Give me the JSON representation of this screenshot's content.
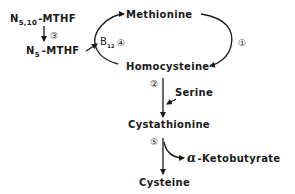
{
  "diagram": {
    "nodes": {
      "methionine": "Methionine",
      "homocysteine": "Homocysteine",
      "cystathionine": "Cystathionine",
      "cysteine": "Cysteine",
      "serine": "Serine",
      "ketobutyrate_greek": "α",
      "ketobutyrate": "-Ketobutyrate",
      "mthf510_n": "N",
      "mthf510_sub": "5,10",
      "mthf510_rest": "-MTHF",
      "mthf5_n": "N",
      "mthf5_sub": "5",
      "mthf5_rest": "-MTHF",
      "b12": "B",
      "b12_sub": "12"
    },
    "steps": {
      "step1": "①",
      "step2": "②",
      "step3": "③",
      "step4": "④",
      "step5": "⑤"
    },
    "edges": [
      {
        "from": "Methionine",
        "to": "Homocysteine",
        "step": "①"
      },
      {
        "from": "Homocysteine",
        "to": "Methionine",
        "step": "④",
        "cofactor": "B12",
        "donor": "N5-MTHF"
      },
      {
        "from": "N5,10-MTHF",
        "to": "N5-MTHF",
        "step": "③"
      },
      {
        "from": "Homocysteine",
        "to": "Cystathionine",
        "step": "②",
        "input": "Serine"
      },
      {
        "from": "Cystathionine",
        "to": "Cysteine",
        "step": "⑤",
        "output": "α-Ketobutyrate"
      }
    ]
  }
}
